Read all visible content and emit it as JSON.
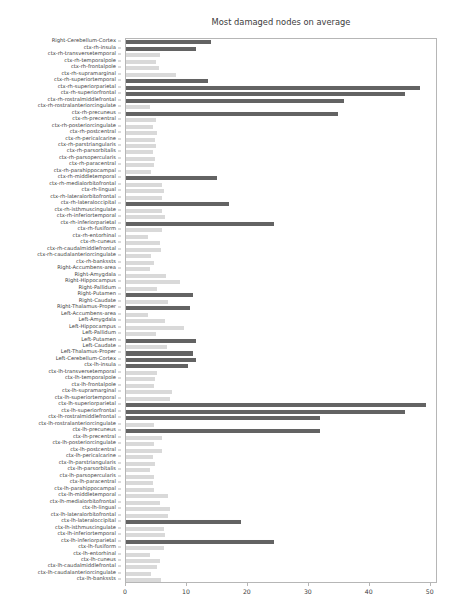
{
  "chart_data": {
    "type": "bar",
    "orientation": "horizontal",
    "title": "Most damaged nodes on average",
    "xlabel": "",
    "ylabel": "",
    "xlim": [
      0,
      51.2
    ],
    "ylim": [
      0,
      84
    ],
    "grid": false,
    "legend": null,
    "xticks": [
      0,
      10,
      20,
      30,
      40,
      50
    ],
    "xtick_labels": [
      "0",
      "10",
      "20",
      "30",
      "40",
      "50"
    ],
    "colors": {
      "highlight": "#636363",
      "normal": "#d9d9d9",
      "axis": "#b6b6b6",
      "text": "#3c3c3c"
    },
    "categories": [
      "Right-Cerebellum-Cortex",
      "ctx-rh-insula",
      "ctx-rh-transversetemporal",
      "ctx-rh-temporalpole",
      "ctx-rh-frontalpole",
      "ctx-rh-supramarginal",
      "ctx-rh-superiortemporal",
      "ctx-rh-superiorparietal",
      "ctx-rh-superiorfrontal",
      "ctx-rh-rostralmiddlefrontal",
      "ctx-rh-rostralanteriorcingulate",
      "ctx-rh-precuneus",
      "ctx-rh-precentral",
      "ctx-rh-posteriorcingulate",
      "ctx-rh-postcentral",
      "ctx-rh-pericalcarine",
      "ctx-rh-parstriangularis",
      "ctx-rh-parsorbitalis",
      "ctx-rh-parsopercularis",
      "ctx-rh-paracentral",
      "ctx-rh-parahippocampal",
      "ctx-rh-middletemporal",
      "ctx-rh-medialorbitofrontal",
      "ctx-rh-lingual",
      "ctx-rh-lateralorbitofrontal",
      "ctx-rh-lateraloccipital",
      "ctx-rh-isthmuscingulate",
      "ctx-rh-inferiortemporal",
      "ctx-rh-inferiorparietal",
      "ctx-rh-fusiform",
      "ctx-rh-entorhinal",
      "ctx-rh-cuneus",
      "ctx-rh-caudalmiddlefrontal",
      "ctx-rh-caudalanteriorcingulate",
      "ctx-rh-bankssts",
      "Right-Accumbens-area",
      "Right-Amygdala",
      "Right-Hippocampus",
      "Right-Pallidum",
      "Right-Putamen",
      "Right-Caudate",
      "Right-Thalamus-Proper",
      "Left-Accumbens-area",
      "Left-Amygdala",
      "Left-Hippocampus",
      "Left-Pallidum",
      "Left-Putamen",
      "Left-Caudate",
      "Left-Thalamus-Proper",
      "Left-Cerebellum-Cortex",
      "ctx-lh-insula",
      "ctx-lh-transversetemporal",
      "ctx-lh-temporalpole",
      "ctx-lh-frontalpole",
      "ctx-lh-supramarginal",
      "ctx-lh-superiortemporal",
      "ctx-lh-superiorparietal",
      "ctx-lh-superiorfrontal",
      "ctx-lh-rostralmiddlefrontal",
      "ctx-lh-rostralanteriorcingulate",
      "ctx-lh-precuneus",
      "ctx-lh-precentral",
      "ctx-lh-posteriorcingulate",
      "ctx-lh-postcentral",
      "ctx-lh-pericalcarine",
      "ctx-lh-parstriangularis",
      "ctx-lh-parsorbitalis",
      "ctx-lh-parsopercularis",
      "ctx-lh-paracentral",
      "ctx-lh-parahippocampal",
      "ctx-lh-middletemporal",
      "ctx-lh-medialorbitofrontal",
      "ctx-lh-lingual",
      "ctx-lh-lateralorbitofrontal",
      "ctx-lh-lateraloccipital",
      "ctx-lh-isthmuscingulate",
      "ctx-lh-inferiortemporal",
      "ctx-lh-inferiorparietal",
      "ctx-lh-fusiform",
      "ctx-lh-entorhinal",
      "ctx-lh-cuneus",
      "ctx-lh-caudalmiddlefrontal",
      "ctx-lh-caudalanteriorcingulate",
      "ctx-lh-bankssts"
    ],
    "values": [
      14.0,
      11.5,
      5.6,
      5.0,
      5.4,
      8.2,
      13.5,
      48.5,
      46.0,
      36.0,
      4.0,
      35.0,
      5.0,
      4.4,
      5.2,
      4.8,
      5.0,
      4.4,
      4.8,
      4.6,
      4.2,
      15.0,
      6.0,
      6.2,
      6.0,
      17.0,
      6.0,
      6.4,
      24.5,
      6.0,
      3.6,
      5.6,
      5.8,
      4.2,
      4.6,
      4.0,
      6.6,
      9.0,
      5.2,
      11.0,
      7.0,
      10.5,
      3.6,
      6.4,
      9.5,
      5.0,
      11.5,
      6.8,
      11.0,
      11.5,
      10.2,
      5.2,
      4.8,
      4.6,
      7.6,
      7.2,
      49.5,
      46.0,
      32.0,
      4.6,
      32.0,
      6.0,
      4.6,
      6.0,
      4.4,
      4.8,
      4.0,
      4.6,
      4.4,
      4.6,
      7.0,
      5.6,
      7.2,
      7.0,
      19.0,
      6.2,
      6.4,
      24.5,
      6.2,
      4.0,
      5.6,
      5.2,
      4.2,
      5.8
    ],
    "highlighted": [
      true,
      true,
      false,
      false,
      false,
      false,
      true,
      true,
      true,
      true,
      false,
      true,
      false,
      false,
      false,
      false,
      false,
      false,
      false,
      false,
      false,
      true,
      false,
      false,
      false,
      true,
      false,
      false,
      true,
      false,
      false,
      false,
      false,
      false,
      false,
      false,
      false,
      false,
      false,
      true,
      false,
      true,
      false,
      false,
      false,
      false,
      true,
      false,
      true,
      true,
      true,
      false,
      false,
      false,
      false,
      false,
      true,
      true,
      true,
      false,
      true,
      false,
      false,
      false,
      false,
      false,
      false,
      false,
      false,
      false,
      false,
      false,
      false,
      false,
      true,
      false,
      false,
      true,
      false,
      false,
      false,
      false,
      false,
      false
    ]
  }
}
